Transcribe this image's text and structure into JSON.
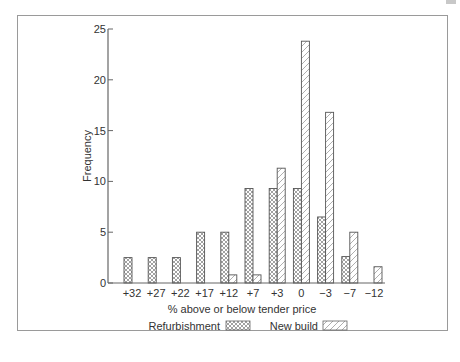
{
  "chart_data": {
    "type": "bar",
    "title": "",
    "xlabel": "% above or below tender price",
    "ylabel": "Frequency",
    "ylim": [
      0,
      25
    ],
    "yticks": [
      0,
      5,
      10,
      15,
      20,
      25
    ],
    "grid": false,
    "legend_position": "bottom-center",
    "categories": [
      "+32",
      "+27",
      "+22",
      "+17",
      "+12",
      "+7",
      "+3",
      "0",
      "−3",
      "−7",
      "−12"
    ],
    "series": [
      {
        "name": "Refurbishment",
        "pattern": "crosshatch",
        "values": [
          2.5,
          2.5,
          2.5,
          5,
          5,
          9.3,
          9.3,
          9.3,
          6.5,
          2.6,
          0
        ]
      },
      {
        "name": "New build",
        "pattern": "diagonal-hatch",
        "values": [
          0,
          0,
          0,
          0,
          0.8,
          0.8,
          11.3,
          23.8,
          16.8,
          5,
          1.6
        ]
      }
    ],
    "colors": {
      "stroke": "#555555",
      "hatch": "#888888",
      "axis": "#666666",
      "text": "#333333"
    }
  }
}
